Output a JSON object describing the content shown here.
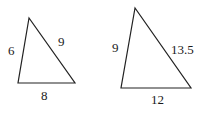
{
  "diagram": {
    "triangles": [
      {
        "name": "small-triangle",
        "sides": {
          "left": "6",
          "right": "9",
          "bottom": "8"
        }
      },
      {
        "name": "large-triangle",
        "sides": {
          "left": "9",
          "right": "13.5",
          "bottom": "12"
        }
      }
    ]
  }
}
